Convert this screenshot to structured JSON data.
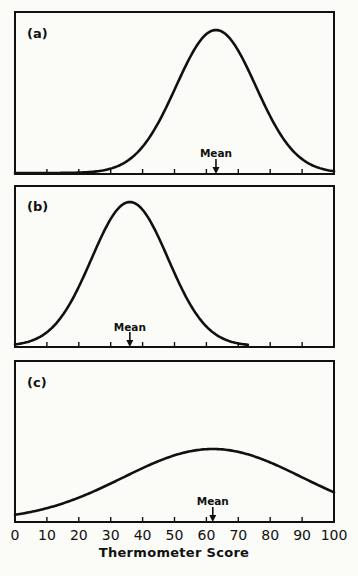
{
  "chart_data": [
    {
      "type": "line",
      "panel_label": "(a)",
      "title": "(a)",
      "xlabel": "",
      "ylabel": "",
      "xlim": [
        0,
        100
      ],
      "x_ticks": [
        0,
        10,
        20,
        30,
        40,
        50,
        60,
        70,
        80,
        90,
        100
      ],
      "distribution": "normal",
      "mean": 63,
      "sd": 12.5,
      "mean_annotation": "Mean",
      "x": [
        0,
        10,
        20,
        30,
        40,
        50,
        60,
        63,
        70,
        80,
        90,
        100
      ],
      "y_relative": [
        0.0,
        0.0,
        0.01,
        0.05,
        0.19,
        0.58,
        0.97,
        1.0,
        0.84,
        0.4,
        0.1,
        0.01
      ],
      "curve_x_range": [
        0,
        100
      ]
    },
    {
      "type": "line",
      "panel_label": "(b)",
      "title": "(b)",
      "xlabel": "",
      "ylabel": "",
      "xlim": [
        0,
        100
      ],
      "x_ticks": [
        0,
        10,
        20,
        30,
        40,
        50,
        60,
        70,
        80,
        90,
        100
      ],
      "distribution": "normal",
      "mean": 36,
      "sd": 12,
      "mean_annotation": "Mean",
      "x": [
        0,
        10,
        20,
        30,
        36,
        40,
        50,
        60,
        70,
        73
      ],
      "y_relative": [
        0.03,
        0.1,
        0.41,
        0.88,
        1.0,
        0.95,
        0.51,
        0.14,
        0.02,
        0.01
      ],
      "curve_x_range": [
        0,
        73
      ]
    },
    {
      "type": "line",
      "panel_label": "(c)",
      "title": "(c)",
      "xlabel": "Thermometer Score",
      "ylabel": "",
      "xlim": [
        0,
        100
      ],
      "x_ticks": [
        0,
        10,
        20,
        30,
        40,
        50,
        60,
        70,
        80,
        90,
        100
      ],
      "x_tick_labels": [
        "0",
        "10",
        "20",
        "30",
        "40",
        "50",
        "60",
        "70",
        "80",
        "90",
        "100"
      ],
      "distribution": "normal",
      "mean": 62,
      "sd": 28,
      "mean_annotation": "Mean",
      "x": [
        0,
        10,
        20,
        30,
        40,
        50,
        60,
        62,
        70,
        80,
        90,
        100
      ],
      "y_relative": [
        0.05,
        0.12,
        0.24,
        0.42,
        0.65,
        0.86,
        0.99,
        1.0,
        0.95,
        0.78,
        0.56,
        0.27
      ],
      "curve_x_range": [
        0,
        100
      ]
    }
  ],
  "axis": {
    "title": "Thermometer Score",
    "tick_labels": [
      "0",
      "10",
      "20",
      "30",
      "40",
      "50",
      "60",
      "70",
      "80",
      "90",
      "100"
    ]
  },
  "panels": [
    {
      "label": "(a)",
      "mean_label": "Mean"
    },
    {
      "label": "(b)",
      "mean_label": "Mean"
    },
    {
      "label": "(c)",
      "mean_label": "Mean"
    }
  ]
}
